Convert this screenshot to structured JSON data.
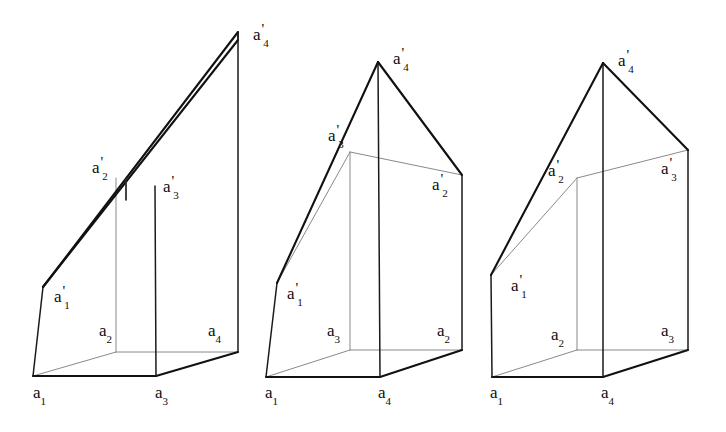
{
  "figure": {
    "background_color": "#ffffff",
    "line_color": "#111111",
    "hidden_line_color": "#8a8a8a",
    "width": 726,
    "height": 432
  },
  "panels": [
    {
      "id": "figure-1",
      "caption": "left figure",
      "base_labels": [
        {
          "name": "a1",
          "base": "a",
          "sub": "1",
          "prime": "",
          "x": 33,
          "y": 384
        },
        {
          "name": "a3",
          "base": "a",
          "sub": "3",
          "prime": "",
          "x": 155,
          "y": 384
        },
        {
          "name": "a2",
          "base": "a",
          "sub": "2",
          "prime": "",
          "x": 99,
          "y": 322
        },
        {
          "name": "a4",
          "base": "a",
          "sub": "4",
          "prime": "",
          "x": 208,
          "y": 322
        }
      ],
      "top_labels": [
        {
          "name": "a1p",
          "base": "a",
          "sub": "1",
          "prime": "'",
          "x": 54,
          "y": 288
        },
        {
          "name": "a2p",
          "base": "a",
          "sub": "2",
          "prime": "'",
          "x": 92,
          "y": 159
        },
        {
          "name": "a3p",
          "base": "a",
          "sub": "3",
          "prime": "'",
          "x": 163,
          "y": 178
        },
        {
          "name": "a4p",
          "base": "a",
          "sub": "4",
          "prime": "'",
          "x": 253,
          "y": 26
        }
      ]
    },
    {
      "id": "figure-2",
      "caption": "middle figure",
      "base_labels": [
        {
          "name": "a1",
          "base": "a",
          "sub": "1",
          "prime": "",
          "x": 265,
          "y": 384
        },
        {
          "name": "a4",
          "base": "a",
          "sub": "4",
          "prime": "",
          "x": 378,
          "y": 384
        },
        {
          "name": "a3",
          "base": "a",
          "sub": "3",
          "prime": "",
          "x": 327,
          "y": 322
        },
        {
          "name": "a2",
          "base": "a",
          "sub": "2",
          "prime": "",
          "x": 437,
          "y": 322
        }
      ],
      "top_labels": [
        {
          "name": "a1p",
          "base": "a",
          "sub": "1",
          "prime": "'",
          "x": 287,
          "y": 285
        },
        {
          "name": "a3p",
          "base": "a",
          "sub": "3",
          "prime": "'",
          "x": 328,
          "y": 127
        },
        {
          "name": "a2p",
          "base": "a",
          "sub": "2",
          "prime": "'",
          "x": 432,
          "y": 176
        },
        {
          "name": "a4p",
          "base": "a",
          "sub": "4",
          "prime": "'",
          "x": 393,
          "y": 50
        }
      ]
    },
    {
      "id": "figure-3",
      "caption": "right figure",
      "base_labels": [
        {
          "name": "a1",
          "base": "a",
          "sub": "1",
          "prime": "",
          "x": 490,
          "y": 384
        },
        {
          "name": "a4",
          "base": "a",
          "sub": "4",
          "prime": "",
          "x": 601,
          "y": 384
        },
        {
          "name": "a2",
          "base": "a",
          "sub": "2",
          "prime": "",
          "x": 551,
          "y": 326
        },
        {
          "name": "a3",
          "base": "a",
          "sub": "3",
          "prime": "",
          "x": 661,
          "y": 322
        }
      ],
      "top_labels": [
        {
          "name": "a1p",
          "base": "a",
          "sub": "1",
          "prime": "'",
          "x": 511,
          "y": 277
        },
        {
          "name": "a2p",
          "base": "a",
          "sub": "2",
          "prime": "'",
          "x": 548,
          "y": 162
        },
        {
          "name": "a3p",
          "base": "a",
          "sub": "3",
          "prime": "'",
          "x": 661,
          "y": 160
        },
        {
          "name": "a4p",
          "base": "a",
          "sub": "4",
          "prime": "'",
          "x": 618,
          "y": 52
        }
      ]
    }
  ],
  "geometry": {
    "figure1": {
      "front_bottom_left": [
        33,
        376
      ],
      "front_bottom_right": [
        156,
        376
      ],
      "back_bottom_right": [
        238,
        352
      ],
      "back_bottom_left": [
        116,
        352
      ],
      "front_top_left": [
        43,
        287
      ],
      "apex": [
        238,
        32
      ],
      "ridge_mid_front": [
        155,
        186
      ],
      "ridge_mid_back": [
        126,
        178
      ]
    },
    "figure2": {
      "front_bottom_left": [
        266,
        377
      ],
      "front_bottom_right": [
        380,
        377
      ],
      "back_bottom_right": [
        462,
        350
      ],
      "back_bottom_left": [
        350,
        350
      ],
      "front_top_left": [
        277,
        283
      ],
      "apex": [
        378,
        62
      ],
      "right_top": [
        462,
        175
      ],
      "back_top_left": [
        350,
        152
      ]
    },
    "figure3": {
      "front_bottom_left": [
        492,
        377
      ],
      "front_bottom_right": [
        603,
        377
      ],
      "back_bottom_right": [
        688,
        350
      ],
      "back_bottom_left": [
        577,
        350
      ],
      "front_top_left": [
        491,
        275
      ],
      "apex": [
        603,
        63
      ],
      "right_top": [
        688,
        150
      ],
      "back_top_left": [
        577,
        178
      ]
    }
  }
}
